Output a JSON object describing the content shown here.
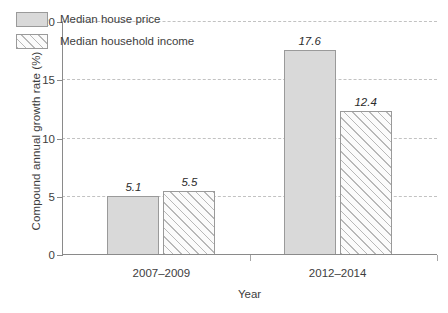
{
  "chart_data": {
    "type": "bar",
    "title": "",
    "xlabel": "Year",
    "ylabel": "Compound annual growth rate (%)",
    "categories": [
      "2007–2009",
      "2012–2014"
    ],
    "series": [
      {
        "name": "Median house price",
        "values": [
          5.1,
          17.6
        ],
        "fill": "solid"
      },
      {
        "name": "Median household income",
        "values": [
          5.5,
          12.4
        ],
        "fill": "hatched"
      }
    ],
    "value_labels": [
      [
        "5.1",
        "5.5"
      ],
      [
        "17.6",
        "12.4"
      ]
    ],
    "ylim": [
      0,
      20
    ],
    "yticks": [
      0,
      5,
      10,
      15,
      20
    ],
    "ytick_labels": [
      "0",
      "5",
      "10",
      "15",
      "20"
    ],
    "grid": true,
    "legend_position": "top-left",
    "colors": {
      "bar_fill": "#d9d9d9",
      "bar_edge": "#9a9a9a",
      "hatch": "#b8b8b8",
      "grid": "#c2c2c2",
      "axis": "#8a8a8a",
      "text": "#3d3d3d",
      "background": "#ffffff"
    }
  }
}
